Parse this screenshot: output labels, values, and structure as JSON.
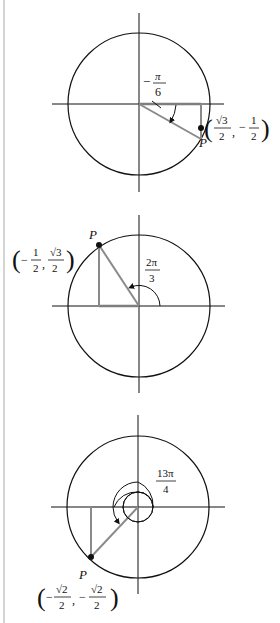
{
  "figure": {
    "colors": {
      "ink": "#111111",
      "triangle": "#8a8a8a",
      "edge": "#d4d4d4"
    },
    "panels": [
      {
        "id": "panel-1",
        "angle_rad": -0.5236,
        "angle_label": {
          "sign": "−",
          "num": "π",
          "den": "6"
        },
        "point_label": "P",
        "coords": {
          "x": {
            "sign": "",
            "num": "√3",
            "den": "2"
          },
          "y": {
            "sign": "−",
            "num": "1",
            "den": "2"
          }
        }
      },
      {
        "id": "panel-2",
        "angle_rad": 2.0944,
        "angle_label": {
          "sign": "",
          "num": "2π",
          "den": "3"
        },
        "point_label": "P",
        "coords": {
          "x": {
            "sign": "−",
            "num": "1",
            "den": "2"
          },
          "y": {
            "sign": "",
            "num": "√3",
            "den": "2"
          }
        }
      },
      {
        "id": "panel-3",
        "angle_rad": 10.2102,
        "angle_label": {
          "sign": "",
          "num": "13π",
          "den": "4"
        },
        "point_label": "P",
        "coords": {
          "x": {
            "sign": "−",
            "num": "√2",
            "den": "2"
          },
          "y": {
            "sign": "−",
            "num": "√2",
            "den": "2"
          }
        }
      }
    ]
  }
}
